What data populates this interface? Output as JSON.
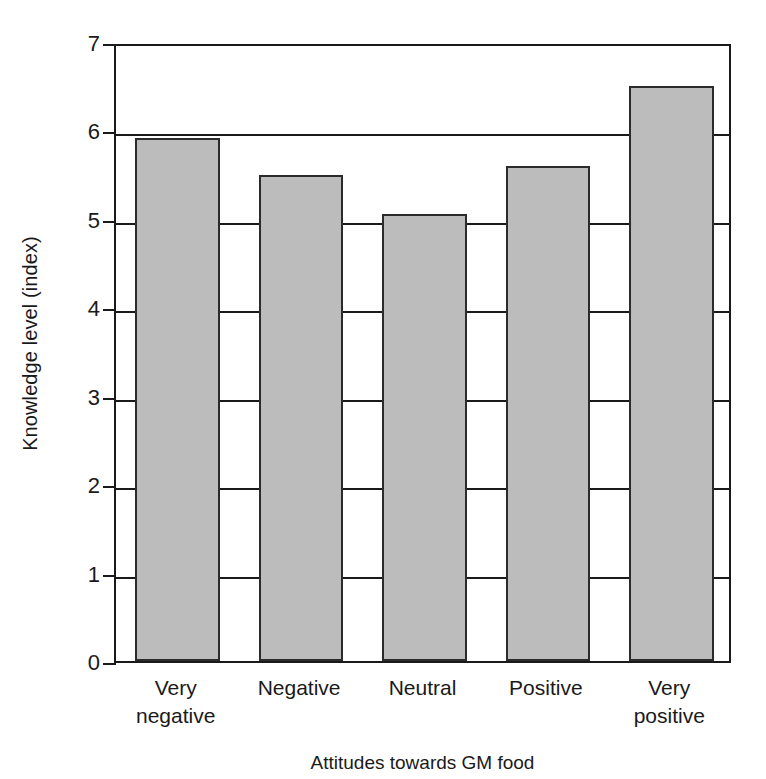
{
  "chart_data": {
    "type": "bar",
    "title": "",
    "xlabel": "Attitudes towards GM food",
    "ylabel": "Knowledge level (index)",
    "categories": [
      "Very negative",
      "Negative",
      "Neutral",
      "Positive",
      "Very positive"
    ],
    "category_lines": [
      [
        "Very",
        "negative"
      ],
      [
        "Negative"
      ],
      [
        "Neutral"
      ],
      [
        "Positive"
      ],
      [
        "Very",
        "positive"
      ]
    ],
    "values": [
      5.92,
      5.5,
      5.05,
      5.6,
      6.5
    ],
    "ylim": [
      0,
      7
    ],
    "yticks": [
      0,
      1,
      2,
      3,
      4,
      5,
      6,
      7
    ],
    "ytick_labels": [
      "0",
      "1",
      "2",
      "3",
      "4",
      "5",
      "6",
      "7"
    ],
    "grid": "horizontal",
    "legend": "none",
    "bar_fill_color": "#bcbcbc",
    "bar_edge_color": "#2b2b2b",
    "axis_color": "#1a1a1a"
  }
}
